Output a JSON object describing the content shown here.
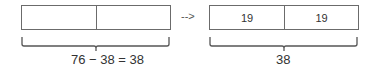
{
  "left_group": {
    "boxes": [
      {
        "value": ""
      },
      {
        "value": ""
      }
    ],
    "equation": "76 − 38 = 38"
  },
  "arrow": "-->",
  "right_group": {
    "boxes": [
      {
        "value": "19"
      },
      {
        "value": "19"
      }
    ],
    "total": "38"
  },
  "colors": {
    "stroke": "#6b6b6b",
    "text": "#333333"
  }
}
